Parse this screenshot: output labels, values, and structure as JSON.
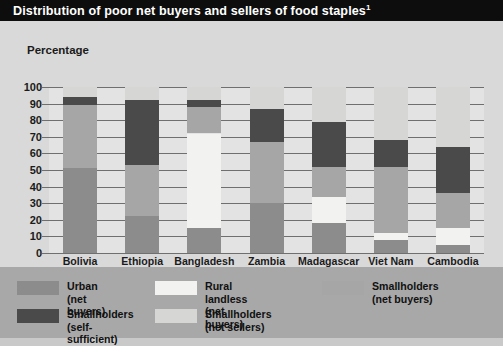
{
  "header": {
    "title": "Distribution of poor net buyers and sellers of food staples",
    "footnote_marker": "1"
  },
  "axis": {
    "y_title": "Percentage",
    "y_ticks": [
      "0",
      "10",
      "20",
      "30",
      "40",
      "50",
      "60",
      "70",
      "80",
      "90",
      "100"
    ]
  },
  "legend": {
    "items": [
      {
        "label": "Urban (net buyers)",
        "color": "#8c8c8c"
      },
      {
        "label": "Rural landless (net buyers)",
        "color": "#f2f2f0"
      },
      {
        "label": "Smallholders (net buyers)",
        "color": "#a6a6a6"
      },
      {
        "label": "Smallholders\n(self-sufficient)",
        "color": "#4a4a4a"
      },
      {
        "label": "Smallholders\n(net sellers)",
        "color": "#d6d6d4"
      }
    ]
  },
  "chart_data": {
    "type": "bar",
    "stacked": true,
    "title": "Distribution of poor net buyers and sellers of food staples",
    "xlabel": "",
    "ylabel": "Percentage",
    "ylim": [
      0,
      100
    ],
    "grid": true,
    "legend_position": "bottom",
    "categories": [
      "Bolivia",
      "Ethiopia",
      "Bangladesh",
      "Zambia",
      "Madagascar",
      "Viet Nam",
      "Cambodia"
    ],
    "series": [
      {
        "name": "Urban (net buyers)",
        "color": "#8c8c8c",
        "values": [
          51,
          22,
          15,
          30,
          18,
          8,
          5
        ]
      },
      {
        "name": "Rural landless (net buyers)",
        "color": "#f2f2f0",
        "values": [
          0,
          0,
          57,
          0,
          16,
          4,
          10
        ]
      },
      {
        "name": "Smallholders (net buyers)",
        "color": "#a6a6a6",
        "values": [
          38,
          31,
          16,
          37,
          18,
          40,
          21
        ]
      },
      {
        "name": "Smallholders (self-sufficient)",
        "color": "#4a4a4a",
        "values": [
          5,
          39,
          4,
          20,
          27,
          16,
          28
        ]
      },
      {
        "name": "Smallholders (net sellers)",
        "color": "#d6d6d4",
        "values": [
          6,
          8,
          8,
          13,
          21,
          32,
          36
        ]
      }
    ]
  }
}
